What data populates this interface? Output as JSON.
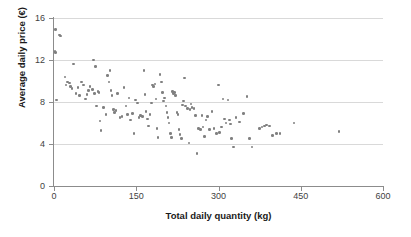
{
  "chart_data": {
    "type": "scatter",
    "title": "",
    "xlabel": "Total daily quantity (kg)",
    "ylabel": "Average daily price (€)",
    "xlim": [
      0,
      600
    ],
    "ylim": [
      0,
      16
    ],
    "xticks": [
      0,
      150,
      300,
      450,
      600
    ],
    "yticks": [
      0,
      4,
      8,
      12,
      16
    ],
    "xtick_labels": [
      "0",
      "150",
      "300",
      "450",
      "600"
    ],
    "ytick_labels": [
      "0",
      "4",
      "8",
      "12",
      "16"
    ],
    "grid": "horizontal",
    "legend": null,
    "marker_color": "#808080",
    "axis_color": "#8c8c8c",
    "grid_color": "#d9d9d9",
    "series": [
      {
        "name": "daily observations",
        "points": [
          [
            3,
            14.9
          ],
          [
            2,
            12.8
          ],
          [
            3,
            12.7
          ],
          [
            10,
            14.4
          ],
          [
            12,
            14.3
          ],
          [
            5,
            8.2
          ],
          [
            20,
            10.4
          ],
          [
            22,
            9.6
          ],
          [
            25,
            9.9
          ],
          [
            28,
            9.8
          ],
          [
            30,
            9.5
          ],
          [
            33,
            9.3
          ],
          [
            36,
            11.6
          ],
          [
            40,
            8.8
          ],
          [
            44,
            9.4
          ],
          [
            47,
            8.6
          ],
          [
            50,
            9.9
          ],
          [
            54,
            9.6
          ],
          [
            57,
            8.3
          ],
          [
            60,
            8.7
          ],
          [
            63,
            9.1
          ],
          [
            66,
            9.5
          ],
          [
            70,
            9.2
          ],
          [
            72,
            12.0
          ],
          [
            74,
            8.8
          ],
          [
            76,
            11.4
          ],
          [
            78,
            7.6
          ],
          [
            80,
            9.0
          ],
          [
            82,
            8.9
          ],
          [
            84,
            6.2
          ],
          [
            86,
            5.3
          ],
          [
            90,
            7.5
          ],
          [
            95,
            6.8
          ],
          [
            98,
            10.5
          ],
          [
            100,
            9.9
          ],
          [
            102,
            11.0
          ],
          [
            104,
            9.1
          ],
          [
            106,
            8.6
          ],
          [
            108,
            7.3
          ],
          [
            110,
            7.0
          ],
          [
            113,
            7.2
          ],
          [
            116,
            8.8
          ],
          [
            120,
            6.5
          ],
          [
            124,
            6.6
          ],
          [
            128,
            9.4
          ],
          [
            131,
            7.6
          ],
          [
            134,
            6.8
          ],
          [
            137,
            8.4
          ],
          [
            140,
            6.3
          ],
          [
            143,
            6.9
          ],
          [
            146,
            5.0
          ],
          [
            149,
            8.2
          ],
          [
            152,
            7.9
          ],
          [
            155,
            6.5
          ],
          [
            158,
            6.7
          ],
          [
            161,
            6.6
          ],
          [
            164,
            11.0
          ],
          [
            166,
            8.7
          ],
          [
            168,
            7.1
          ],
          [
            170,
            6.4
          ],
          [
            172,
            5.7
          ],
          [
            175,
            6.8
          ],
          [
            178,
            7.9
          ],
          [
            180,
            9.6
          ],
          [
            182,
            9.5
          ],
          [
            184,
            9.7
          ],
          [
            186,
            8.3
          ],
          [
            188,
            5.5
          ],
          [
            190,
            4.6
          ],
          [
            193,
            10.6
          ],
          [
            196,
            9.9
          ],
          [
            198,
            8.9
          ],
          [
            200,
            8.1
          ],
          [
            202,
            8.4
          ],
          [
            204,
            7.6
          ],
          [
            206,
            7.0
          ],
          [
            208,
            6.5
          ],
          [
            210,
            6.0
          ],
          [
            212,
            5.0
          ],
          [
            214,
            4.6
          ],
          [
            216,
            9.0
          ],
          [
            218,
            8.8
          ],
          [
            220,
            8.9
          ],
          [
            222,
            8.6
          ],
          [
            224,
            7.0
          ],
          [
            226,
            6.8
          ],
          [
            228,
            5.4
          ],
          [
            230,
            4.9
          ],
          [
            232,
            4.5
          ],
          [
            234,
            7.7
          ],
          [
            236,
            8.1
          ],
          [
            238,
            10.3
          ],
          [
            240,
            7.6
          ],
          [
            243,
            7.4
          ],
          [
            246,
            4.1
          ],
          [
            248,
            7.3
          ],
          [
            250,
            7.8
          ],
          [
            252,
            7.5
          ],
          [
            255,
            7.4
          ],
          [
            258,
            6.7
          ],
          [
            261,
            3.1
          ],
          [
            264,
            5.5
          ],
          [
            267,
            5.4
          ],
          [
            270,
            6.7
          ],
          [
            272,
            5.6
          ],
          [
            274,
            4.7
          ],
          [
            277,
            6.3
          ],
          [
            280,
            6.6
          ],
          [
            284,
            5.4
          ],
          [
            288,
            7.1
          ],
          [
            292,
            5.5
          ],
          [
            296,
            5.0
          ],
          [
            300,
            9.6
          ],
          [
            302,
            5.1
          ],
          [
            305,
            5.6
          ],
          [
            308,
            8.3
          ],
          [
            311,
            6.4
          ],
          [
            314,
            6.0
          ],
          [
            317,
            8.2
          ],
          [
            320,
            6.3
          ],
          [
            322,
            5.9
          ],
          [
            324,
            4.5
          ],
          [
            327,
            3.7
          ],
          [
            332,
            6.5
          ],
          [
            338,
            6.1
          ],
          [
            346,
            6.9
          ],
          [
            352,
            8.5
          ],
          [
            356,
            4.5
          ],
          [
            361,
            3.7
          ],
          [
            375,
            5.5
          ],
          [
            379,
            5.6
          ],
          [
            384,
            5.7
          ],
          [
            388,
            5.8
          ],
          [
            393,
            5.7
          ],
          [
            399,
            4.8
          ],
          [
            406,
            5.0
          ],
          [
            412,
            5.0
          ],
          [
            438,
            6.0
          ],
          [
            520,
            5.2
          ]
        ]
      }
    ]
  }
}
